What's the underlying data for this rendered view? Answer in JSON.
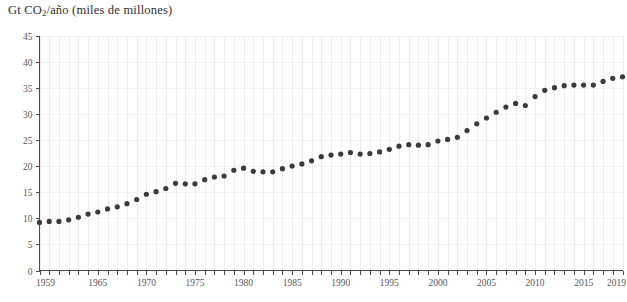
{
  "chart_data": {
    "type": "scatter",
    "title": "Gt CO2/año (miles de millones)",
    "title_prefix": "Gt CO",
    "title_subscript": "2",
    "title_suffix": "/año (miles de millones)",
    "xlabel": "",
    "ylabel": "",
    "ylim": [
      0,
      45
    ],
    "xlim": [
      1959,
      2019
    ],
    "y_ticks": [
      0,
      5,
      10,
      15,
      20,
      25,
      30,
      35,
      40,
      45
    ],
    "y_tick_labels": [
      "0",
      "5",
      "10",
      "15",
      "20",
      "25",
      "30",
      "35",
      "40",
      "45"
    ],
    "x_tick_labels": [
      "1959",
      "1965",
      "1970",
      "1975",
      "1980",
      "1985",
      "1990",
      "1995",
      "2000",
      "2005",
      "2010",
      "2015",
      "2019"
    ],
    "x_tick_label_years": [
      1959,
      1965,
      1970,
      1975,
      1980,
      1985,
      1990,
      1995,
      2000,
      2005,
      2010,
      2015,
      2019
    ],
    "x_minor_tick_step": 1,
    "grid": "vertical",
    "legend": "none",
    "point_color": "#3b3b3d",
    "axis_color": "#4a4a4a",
    "grid_color": "#ececed",
    "background": "#ffffff",
    "x": [
      1959,
      1960,
      1961,
      1962,
      1963,
      1964,
      1965,
      1966,
      1967,
      1968,
      1969,
      1970,
      1971,
      1972,
      1973,
      1974,
      1975,
      1976,
      1977,
      1978,
      1979,
      1980,
      1981,
      1982,
      1983,
      1984,
      1985,
      1986,
      1987,
      1988,
      1989,
      1990,
      1991,
      1992,
      1993,
      1994,
      1995,
      1996,
      1997,
      1998,
      1999,
      2000,
      2001,
      2002,
      2003,
      2004,
      2005,
      2006,
      2007,
      2008,
      2009,
      2010,
      2011,
      2012,
      2013,
      2014,
      2015,
      2016,
      2017,
      2018,
      2019
    ],
    "values": [
      9.2,
      9.4,
      9.4,
      9.7,
      10.2,
      10.8,
      11.2,
      11.8,
      12.2,
      12.8,
      13.6,
      14.6,
      15.1,
      15.7,
      16.7,
      16.6,
      16.6,
      17.4,
      17.9,
      18.1,
      19.2,
      19.6,
      19.0,
      18.9,
      18.9,
      19.5,
      20.0,
      20.4,
      21.0,
      21.8,
      22.1,
      22.3,
      22.6,
      22.3,
      22.4,
      22.7,
      23.2,
      23.8,
      24.1,
      24.0,
      24.1,
      24.8,
      25.1,
      25.5,
      26.8,
      28.1,
      29.2,
      30.3,
      31.3,
      32.0,
      31.6,
      33.3,
      34.5,
      35.0,
      35.4,
      35.5,
      35.5,
      35.5,
      36.2,
      36.8,
      37.1
    ]
  }
}
